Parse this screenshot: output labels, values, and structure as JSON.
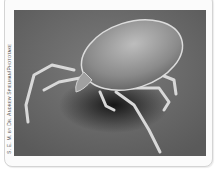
{
  "figure": {
    "credit": "S. E. M. by Dr. Andrew Spielman/Phototake",
    "colors": {
      "background": "#6a6a6a",
      "frame": "#fbfbfb",
      "frame_border": "#d4d4d4"
    }
  }
}
